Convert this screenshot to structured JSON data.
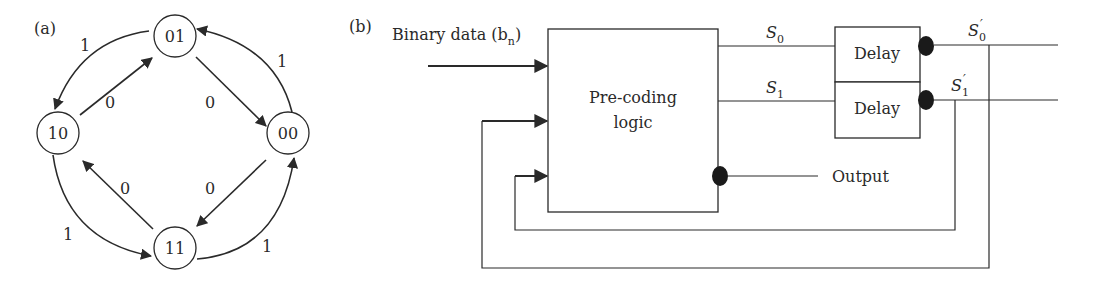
{
  "figure": {
    "panel_a": {
      "label": "(a)",
      "states": [
        {
          "id": "01",
          "label": "01"
        },
        {
          "id": "10",
          "label": "10"
        },
        {
          "id": "00",
          "label": "00"
        },
        {
          "id": "11",
          "label": "11"
        }
      ],
      "transitions": [
        {
          "from": "01",
          "to": "10",
          "label": "1"
        },
        {
          "from": "10",
          "to": "01",
          "label": "0"
        },
        {
          "from": "01",
          "to": "00",
          "label": "0"
        },
        {
          "from": "00",
          "to": "01",
          "label": "1"
        },
        {
          "from": "10",
          "to": "11",
          "label": "1"
        },
        {
          "from": "11",
          "to": "10",
          "label": "0"
        },
        {
          "from": "00",
          "to": "11",
          "label": "0"
        },
        {
          "from": "11",
          "to": "00",
          "label": "1"
        }
      ]
    },
    "panel_b": {
      "label": "(b)",
      "input_label": "Binary data (b",
      "input_subscript": "n",
      "input_close": ")",
      "block_label_line1": "Pre-coding",
      "block_label_line2": "logic",
      "signal_s0": "S",
      "signal_s0_sub": "0",
      "signal_s1": "S",
      "signal_s1_sub": "1",
      "delay1_label": "Delay",
      "delay2_label": "Delay",
      "signal_s0_prime": "S",
      "signal_s0_prime_sub": "0",
      "signal_s1_prime": "S",
      "signal_s1_prime_sub": "1",
      "prime_mark": "′",
      "output_label": "Output"
    }
  }
}
